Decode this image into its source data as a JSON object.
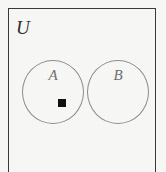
{
  "figure": {
    "kind": "venn-diagram",
    "width": 166,
    "height": 172,
    "background_color": "#f6f6f5"
  },
  "universe": {
    "label": "U",
    "border_color": "#3a3a3a"
  },
  "sets": [
    {
      "id": "A",
      "label": "A",
      "stroke_color": "#8d8d8d",
      "center_x": 53,
      "center_y": 92,
      "radius": 31
    },
    {
      "id": "B",
      "label": "B",
      "stroke_color": "#8d8d8d",
      "center_x": 118,
      "center_y": 92,
      "radius": 31
    }
  ],
  "elements": [
    {
      "id": "point-1",
      "shape": "square",
      "color": "#111111",
      "size": 8,
      "x": 58,
      "y": 99,
      "member_of": "A"
    }
  ]
}
